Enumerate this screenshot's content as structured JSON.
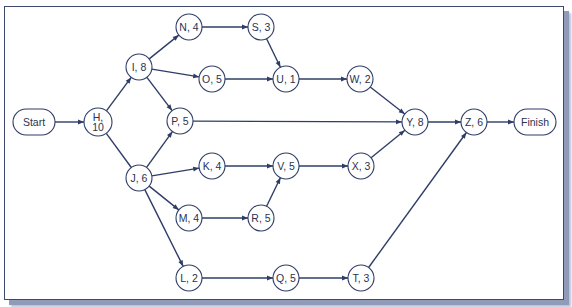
{
  "diagram": {
    "type": "activity-on-node network",
    "colors": {
      "line": "#2f3d66",
      "text": "#2a3350",
      "frame": "#3d4a6b",
      "shadow": "#8f9bb8"
    },
    "nodes": [
      {
        "id": "Start",
        "label": "Start",
        "shape": "pill",
        "x": 34,
        "y": 122
      },
      {
        "id": "H",
        "label": "H,",
        "label2": "10",
        "shape": "circle",
        "x": 98,
        "y": 122
      },
      {
        "id": "I",
        "label": "I, 8",
        "shape": "circle",
        "x": 139,
        "y": 67
      },
      {
        "id": "J",
        "label": "J, 6",
        "shape": "circle",
        "x": 139,
        "y": 178
      },
      {
        "id": "N",
        "label": "N, 4",
        "shape": "circle",
        "x": 189,
        "y": 27
      },
      {
        "id": "S",
        "label": "S, 3",
        "shape": "circle",
        "x": 261,
        "y": 27
      },
      {
        "id": "O",
        "label": "O, 5",
        "shape": "circle",
        "x": 212,
        "y": 79
      },
      {
        "id": "U",
        "label": "U, 1",
        "shape": "circle",
        "x": 286,
        "y": 79
      },
      {
        "id": "W",
        "label": "W, 2",
        "shape": "circle",
        "x": 360,
        "y": 79
      },
      {
        "id": "P",
        "label": "P, 5",
        "shape": "circle",
        "x": 180,
        "y": 121
      },
      {
        "id": "K",
        "label": "K, 4",
        "shape": "circle",
        "x": 212,
        "y": 166
      },
      {
        "id": "V",
        "label": "V, 5",
        "shape": "circle",
        "x": 286,
        "y": 166
      },
      {
        "id": "X",
        "label": "X, 3",
        "shape": "circle",
        "x": 361,
        "y": 166
      },
      {
        "id": "M",
        "label": "M, 4",
        "shape": "circle",
        "x": 189,
        "y": 218
      },
      {
        "id": "R",
        "label": "R, 5",
        "shape": "circle",
        "x": 261,
        "y": 218
      },
      {
        "id": "L",
        "label": "L, 2",
        "shape": "circle",
        "x": 189,
        "y": 278
      },
      {
        "id": "Q",
        "label": "Q, 5",
        "shape": "circle",
        "x": 286,
        "y": 278
      },
      {
        "id": "T",
        "label": "T, 3",
        "shape": "circle",
        "x": 361,
        "y": 278
      },
      {
        "id": "Y",
        "label": "Y, 8",
        "shape": "circle",
        "x": 415,
        "y": 122
      },
      {
        "id": "Z",
        "label": "Z, 6",
        "shape": "circle",
        "x": 474,
        "y": 122
      },
      {
        "id": "Finish",
        "label": "Finish",
        "shape": "pill",
        "x": 535,
        "y": 122
      }
    ],
    "edges": [
      {
        "from": "Start",
        "to": "H",
        "arrow": true
      },
      {
        "from": "H",
        "to": "I",
        "arrow": true
      },
      {
        "from": "H",
        "to": "J",
        "arrow": false
      },
      {
        "from": "I",
        "to": "N",
        "arrow": true
      },
      {
        "from": "I",
        "to": "O",
        "arrow": true
      },
      {
        "from": "I",
        "to": "P",
        "arrow": true
      },
      {
        "from": "J",
        "to": "P",
        "arrow": true
      },
      {
        "from": "J",
        "to": "K",
        "arrow": true
      },
      {
        "from": "J",
        "to": "M",
        "arrow": true
      },
      {
        "from": "J",
        "to": "L",
        "arrow": true
      },
      {
        "from": "N",
        "to": "S",
        "arrow": true
      },
      {
        "from": "S",
        "to": "U",
        "arrow": true
      },
      {
        "from": "O",
        "to": "U",
        "arrow": true
      },
      {
        "from": "U",
        "to": "W",
        "arrow": true
      },
      {
        "from": "W",
        "to": "Y",
        "arrow": true
      },
      {
        "from": "P",
        "to": "Y",
        "arrow": true
      },
      {
        "from": "K",
        "to": "V",
        "arrow": true
      },
      {
        "from": "M",
        "to": "R",
        "arrow": true
      },
      {
        "from": "R",
        "to": "V",
        "arrow": true
      },
      {
        "from": "V",
        "to": "X",
        "arrow": true
      },
      {
        "from": "X",
        "to": "Y",
        "arrow": true
      },
      {
        "from": "L",
        "to": "Q",
        "arrow": true
      },
      {
        "from": "Q",
        "to": "T",
        "arrow": true
      },
      {
        "from": "T",
        "to": "Z",
        "arrow": true
      },
      {
        "from": "Y",
        "to": "Z",
        "arrow": true
      },
      {
        "from": "Z",
        "to": "Finish",
        "arrow": true
      }
    ]
  }
}
